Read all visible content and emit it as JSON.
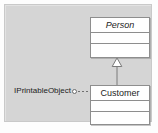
{
  "figure": {
    "kind": "uml-class-diagram",
    "background_color": "#d5d5d5",
    "frame_color": "#c9c9c9",
    "page_background": "#fdfdfd"
  },
  "classes": [
    {
      "id": "person",
      "name": "Person",
      "abstract": true,
      "font_style": "italic",
      "compartments": [
        "name",
        "attributes",
        "operations"
      ],
      "attributes": [],
      "operations": []
    },
    {
      "id": "customer",
      "name": "Customer",
      "abstract": false,
      "font_style": "normal",
      "compartments": [
        "name",
        "attributes",
        "operations"
      ],
      "attributes": [],
      "operations": []
    }
  ],
  "interface": {
    "name": "IPrintableObject",
    "notation": "lollipop",
    "realized_by": "customer",
    "line_style": "dashed",
    "ball_fill": "#ffffff",
    "ball_stroke": "#6d6d6d"
  },
  "relationships": [
    {
      "type": "generalization",
      "source": "customer",
      "target": "person",
      "arrow": "hollow-triangle",
      "line_style": "solid",
      "stroke": "#7a7a7a"
    }
  ],
  "colors": {
    "class_fill": "#ffffff",
    "class_stroke": "#8e8e8e",
    "text": "#1c1c1c",
    "connector": "#7a7a7a"
  }
}
